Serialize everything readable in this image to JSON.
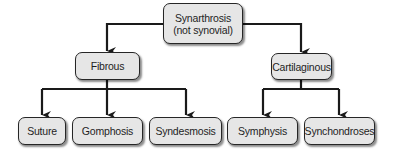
{
  "diagram": {
    "type": "hierarchy-tree",
    "root": {
      "line1": "Synarthrosis",
      "line2": "(not synovial)"
    },
    "branches": [
      {
        "label": "Fibrous",
        "children": [
          {
            "label": "Suture"
          },
          {
            "label": "Gomphosis"
          },
          {
            "label": "Syndesmosis"
          }
        ]
      },
      {
        "label": "Cartilaginous",
        "children": [
          {
            "label": "Symphysis"
          },
          {
            "label": "Synchondroses"
          }
        ]
      }
    ],
    "colors": {
      "box_fill": "#e6e6e6",
      "box_border": "#262626",
      "connector": "#1a1a1a"
    }
  }
}
